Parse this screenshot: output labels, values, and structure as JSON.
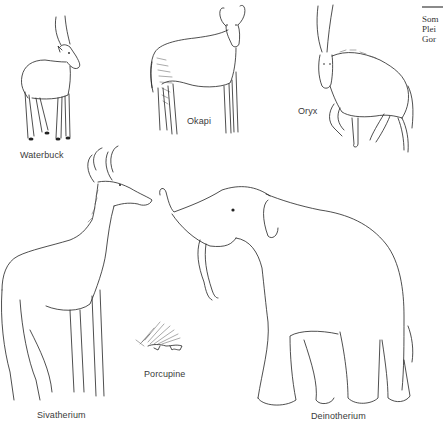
{
  "figure": {
    "animals": [
      {
        "id": "waterbuck",
        "label": "Waterbuck"
      },
      {
        "id": "okapi",
        "label": "Okapi"
      },
      {
        "id": "oryx",
        "label": "Oryx"
      },
      {
        "id": "sivatherium",
        "label": "Sivatherium"
      },
      {
        "id": "porcupine",
        "label": "Porcupine"
      },
      {
        "id": "deinotherium",
        "label": "Deinotherium"
      }
    ]
  },
  "side_caption": {
    "lines": [
      "Som",
      "Plei",
      "Gor"
    ]
  },
  "colors": {
    "ink": "#222222",
    "label_text": "#3a3a3a",
    "rule": "#8a8a8a",
    "background": "#ffffff"
  }
}
